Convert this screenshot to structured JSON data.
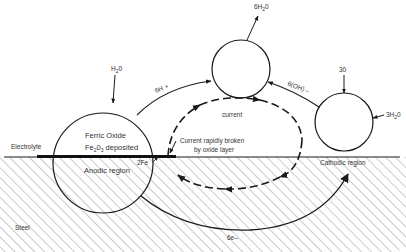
{
  "diagram": {
    "type": "corrosion-cell",
    "colors": {
      "line": "#1a1a1a",
      "hatch": "#8a8a8a",
      "text": "#333333",
      "background": "#ffffff"
    },
    "labels": {
      "electrolyte": "Electrolyte",
      "steel": "Steel",
      "ferric_oxide_line1": "Ferric Oxide",
      "ferric_oxide_line2_main": "Fe",
      "ferric_oxide_line2_sub1": "2",
      "ferric_oxide_line2_mid": "0",
      "ferric_oxide_line2_sub2": "3",
      "ferric_oxide_line2_end": " deposited",
      "anodic_region": "Anodic region",
      "cathodic_region": "Cathodic region",
      "two_fe": "2Fe",
      "h2o_in_main": "H",
      "h2o_in_sub": "2",
      "h2o_in_end": "0",
      "six_h_plus": "6H +",
      "six_h2o_main": "6H",
      "six_h2o_sub": "2",
      "six_h2o_end": "0",
      "six_oh_minus": "6(OH) –",
      "current": "current",
      "current_broken_line1": "Current rapidly broken",
      "current_broken_line2": "by oxide layer",
      "three_o": "30",
      "three_h2o_main": "3H",
      "three_h2o_sub": "2",
      "three_h2o_end": "0",
      "six_e_minus": "6e–"
    },
    "nodes": [
      {
        "id": "anode-circle",
        "cx": 103,
        "cy": 163,
        "r": 50
      },
      {
        "id": "hydrolysis-circle",
        "cx": 241,
        "cy": 69,
        "r": 29
      },
      {
        "id": "cathode-circle",
        "cx": 344,
        "cy": 122,
        "r": 29
      }
    ]
  }
}
